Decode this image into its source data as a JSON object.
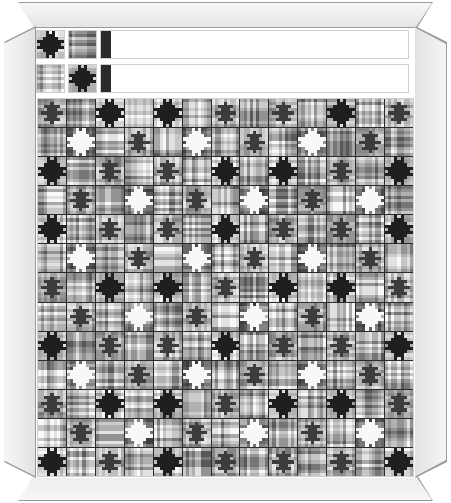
{
  "artwork": {
    "title": "Plaid Star Quilt Design",
    "medium": "framed textile pattern",
    "palette_name": "grayscale",
    "frame": {
      "style": "mitered-picture-frame",
      "face_color": "#eeeeee",
      "edge_color": "#9a9a9a",
      "mat_color": "#ffffff"
    },
    "colors": {
      "shade_0": "#1f1f1f",
      "shade_1": "#3c3c3c",
      "shade_2": "#585858",
      "shade_3": "#777777",
      "shade_4": "#949494",
      "shade_5": "#b0b0b0",
      "shade_6": "#cbcbcb",
      "shade_7": "#e6e6e6",
      "shade_8": "#f8f8f8",
      "grid_line": "#2b2b2b",
      "block_outline": "#cfcfcf"
    },
    "layout": {
      "sample_strip_rows": 2,
      "samples_before_band": 2,
      "band_blocks_per_row": 11,
      "field_columns": 13,
      "field_rows": 13,
      "block_cells": 9,
      "block_size_px": 29
    }
  },
  "block_types": {
    "dark_star_on_light": {
      "name": "dark-star-on-light",
      "star_shade": "shade_0",
      "ground_shade": "shade_7",
      "plaid_shades": [
        "shade_4",
        "shade_6",
        "shade_8",
        "shade_5"
      ]
    },
    "light_star_on_dark": {
      "name": "light-star-on-dark",
      "star_shade": "shade_8",
      "ground_shade": "shade_2",
      "plaid_shades": [
        "shade_3",
        "shade_1",
        "shade_5",
        "shade_2"
      ]
    },
    "plain_plaid": {
      "name": "plain-plaid",
      "star_shade": null,
      "ground_shade": "shade_5",
      "plaid_shades": [
        "shade_2",
        "shade_6",
        "shade_4",
        "shade_8"
      ]
    },
    "mid_star": {
      "name": "mid-star-on-mid",
      "star_shade": "shade_1",
      "ground_shade": "shade_5",
      "plaid_shades": [
        "shade_3",
        "shade_6",
        "shade_7",
        "shade_4"
      ]
    }
  },
  "star_mask": [
    [
      0,
      0,
      0,
      1,
      0,
      1,
      0,
      0,
      0
    ],
    [
      0,
      0,
      0,
      1,
      1,
      1,
      0,
      0,
      0
    ],
    [
      0,
      0,
      1,
      1,
      1,
      1,
      1,
      0,
      0
    ],
    [
      1,
      1,
      1,
      1,
      1,
      1,
      1,
      1,
      1
    ],
    [
      0,
      1,
      1,
      1,
      1,
      1,
      1,
      1,
      0
    ],
    [
      1,
      1,
      1,
      1,
      1,
      1,
      1,
      1,
      1
    ],
    [
      0,
      0,
      1,
      1,
      1,
      1,
      1,
      0,
      0
    ],
    [
      0,
      0,
      0,
      1,
      1,
      1,
      0,
      0,
      0
    ],
    [
      0,
      0,
      0,
      1,
      0,
      1,
      0,
      0,
      0
    ]
  ],
  "diamond_mask": [
    [
      0,
      0,
      0,
      0,
      0,
      0,
      0,
      0,
      0
    ],
    [
      0,
      0,
      0,
      0,
      1,
      0,
      0,
      0,
      0
    ],
    [
      0,
      0,
      1,
      1,
      1,
      1,
      1,
      0,
      0
    ],
    [
      0,
      0,
      0,
      1,
      1,
      1,
      0,
      0,
      0
    ],
    [
      0,
      1,
      1,
      1,
      1,
      1,
      1,
      1,
      0
    ],
    [
      0,
      0,
      0,
      1,
      1,
      1,
      0,
      0,
      0
    ],
    [
      0,
      0,
      1,
      1,
      1,
      1,
      1,
      0,
      0
    ],
    [
      0,
      0,
      0,
      0,
      1,
      0,
      0,
      0,
      0
    ],
    [
      0,
      0,
      0,
      0,
      0,
      0,
      0,
      0,
      0
    ]
  ],
  "strip_row_1": {
    "samples": [
      "dark_star_on_light",
      "plain_plaid"
    ],
    "band": [
      "diamond_light",
      "plain_plaid",
      "diamond_light",
      "plain_plaid",
      "diamond_light",
      "plain_plaid",
      "dark_star_on_light",
      "plain_plaid",
      "diamond_light",
      "plain_plaid",
      "dark_star_on_light"
    ]
  },
  "strip_row_2": {
    "samples": [
      "plain_plaid",
      "dark_star_on_light"
    ],
    "band": [
      "plain_plaid",
      "dark_star_on_light",
      "plain_plaid",
      "dark_star_on_light",
      "plain_plaid",
      "diamond_light",
      "plain_plaid",
      "dark_star_on_light",
      "plain_plaid",
      "diamond_light",
      "plain_plaid"
    ]
  },
  "field_blocks": [
    [
      "diamond_light",
      "plain_plaid",
      "dark_star_on_light",
      "plain_plaid",
      "dark_star_on_light",
      "plain_plaid",
      "diamond_light",
      "plain_plaid",
      "diamond_light",
      "plain_plaid",
      "dark_star_on_light",
      "plain_plaid",
      "diamond_light"
    ],
    [
      "plain_plaid",
      "light_star_on_dark",
      "plain_plaid",
      "diamond_light",
      "plain_plaid",
      "light_star_on_dark",
      "plain_plaid",
      "diamond_light",
      "plain_plaid",
      "light_star_on_dark",
      "plain_plaid",
      "diamond_light",
      "plain_plaid"
    ],
    [
      "dark_star_on_light",
      "plain_plaid",
      "diamond_light",
      "plain_plaid",
      "diamond_light",
      "plain_plaid",
      "dark_star_on_light",
      "plain_plaid",
      "dark_star_on_light",
      "plain_plaid",
      "diamond_light",
      "plain_plaid",
      "dark_star_on_light"
    ],
    [
      "plain_plaid",
      "diamond_light",
      "plain_plaid",
      "light_star_on_dark",
      "plain_plaid",
      "diamond_light",
      "plain_plaid",
      "light_star_on_dark",
      "plain_plaid",
      "diamond_light",
      "plain_plaid",
      "light_star_on_dark",
      "plain_plaid"
    ],
    [
      "dark_star_on_light",
      "plain_plaid",
      "diamond_light",
      "plain_plaid",
      "diamond_light",
      "plain_plaid",
      "dark_star_on_light",
      "plain_plaid",
      "diamond_light",
      "plain_plaid",
      "diamond_light",
      "plain_plaid",
      "dark_star_on_light"
    ],
    [
      "plain_plaid",
      "light_star_on_dark",
      "plain_plaid",
      "diamond_light",
      "plain_plaid",
      "light_star_on_dark",
      "plain_plaid",
      "diamond_light",
      "plain_plaid",
      "light_star_on_dark",
      "plain_plaid",
      "diamond_light",
      "plain_plaid"
    ],
    [
      "diamond_light",
      "plain_plaid",
      "dark_star_on_light",
      "plain_plaid",
      "dark_star_on_light",
      "plain_plaid",
      "diamond_light",
      "plain_plaid",
      "dark_star_on_light",
      "plain_plaid",
      "dark_star_on_light",
      "plain_plaid",
      "diamond_light"
    ],
    [
      "plain_plaid",
      "diamond_light",
      "plain_plaid",
      "light_star_on_dark",
      "plain_plaid",
      "diamond_light",
      "plain_plaid",
      "light_star_on_dark",
      "plain_plaid",
      "diamond_light",
      "plain_plaid",
      "light_star_on_dark",
      "plain_plaid"
    ],
    [
      "dark_star_on_light",
      "plain_plaid",
      "diamond_light",
      "plain_plaid",
      "diamond_light",
      "plain_plaid",
      "dark_star_on_light",
      "plain_plaid",
      "diamond_light",
      "plain_plaid",
      "diamond_light",
      "plain_plaid",
      "dark_star_on_light"
    ],
    [
      "plain_plaid",
      "light_star_on_dark",
      "plain_plaid",
      "diamond_light",
      "plain_plaid",
      "light_star_on_dark",
      "plain_plaid",
      "diamond_light",
      "plain_plaid",
      "light_star_on_dark",
      "plain_plaid",
      "diamond_light",
      "plain_plaid"
    ],
    [
      "diamond_light",
      "plain_plaid",
      "dark_star_on_light",
      "plain_plaid",
      "dark_star_on_light",
      "plain_plaid",
      "diamond_light",
      "plain_plaid",
      "dark_star_on_light",
      "plain_plaid",
      "dark_star_on_light",
      "plain_plaid",
      "diamond_light"
    ],
    [
      "plain_plaid",
      "diamond_light",
      "plain_plaid",
      "light_star_on_dark",
      "plain_plaid",
      "diamond_light",
      "plain_plaid",
      "light_star_on_dark",
      "plain_plaid",
      "diamond_light",
      "plain_plaid",
      "light_star_on_dark",
      "plain_plaid"
    ],
    [
      "dark_star_on_light",
      "plain_plaid",
      "diamond_light",
      "plain_plaid",
      "dark_star_on_light",
      "plain_plaid",
      "diamond_light",
      "plain_plaid",
      "diamond_light",
      "plain_plaid",
      "diamond_light",
      "plain_plaid",
      "dark_star_on_light"
    ]
  ]
}
